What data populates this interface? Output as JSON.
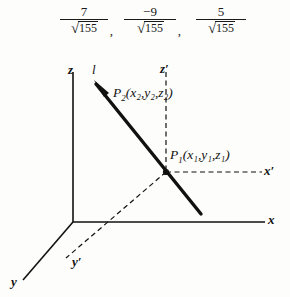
{
  "formulas": [
    {
      "id": "direction-cosine-x",
      "numerator": "7",
      "radicand": "155",
      "trailing": ","
    },
    {
      "id": "direction-cosine-y",
      "numerator": "−9",
      "radicand": "155",
      "trailing": ","
    },
    {
      "id": "direction-cosine-z",
      "numerator": "5",
      "radicand": "155",
      "trailing": ""
    }
  ],
  "radical_sign": "√",
  "diagram": {
    "axes": [
      {
        "name": "z-axis",
        "label": "z",
        "prime": false
      },
      {
        "name": "x-axis",
        "label": "x",
        "prime": false
      },
      {
        "name": "y-axis",
        "label": "y",
        "prime": false
      },
      {
        "name": "z-prime-axis",
        "label": "z",
        "prime": true
      },
      {
        "name": "x-prime-axis",
        "label": "x",
        "prime": true
      },
      {
        "name": "y-prime-axis",
        "label": "y",
        "prime": true
      }
    ],
    "line_label": "l",
    "points": [
      {
        "name": "point-p2",
        "label": "P",
        "sub": "2",
        "coords": "(x₂,y₂,z₂)",
        "text": "P2(x2,y2,z2)"
      },
      {
        "name": "point-p1",
        "label": "P",
        "sub": "1",
        "coords": "(x₁,y₁,z₁)",
        "text": "P1(x1,y1,z1)"
      }
    ],
    "colors": {
      "ink": "#111111",
      "background": "#fdfdfb"
    }
  }
}
